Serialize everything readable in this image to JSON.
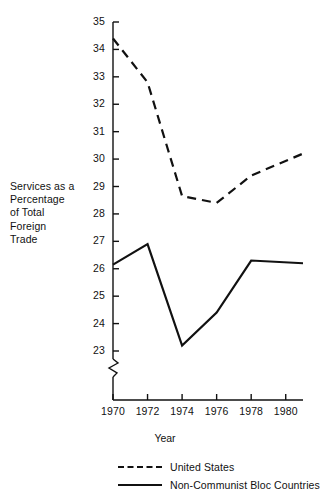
{
  "chart_data": {
    "type": "line",
    "title": "",
    "xlabel": "Year",
    "ylabel": "Services as a Percentage of Total Foreign Trade",
    "ylabel_lines": [
      "Services as a",
      "Percentage",
      "of Total",
      "Foreign",
      "Trade"
    ],
    "xlim": [
      1970,
      1981
    ],
    "ylim": [
      23,
      35
    ],
    "yticks": [
      23,
      24,
      25,
      26,
      27,
      28,
      29,
      30,
      31,
      32,
      33,
      34,
      35
    ],
    "ytick_labels": [
      "23",
      "24",
      "25",
      "26",
      "27",
      "28",
      "29",
      "30",
      "31",
      "32",
      "33",
      "34",
      "35"
    ],
    "xticks": [
      1970,
      1972,
      1974,
      1976,
      1978,
      1980
    ],
    "xtick_labels": [
      "1970",
      "1972",
      "1974",
      "1976",
      "1978",
      "1980"
    ],
    "axis_break": true,
    "axis_break_below": 23,
    "grid": false,
    "legend_position": "bottom",
    "line_color": "#111111",
    "series": [
      {
        "name": "United States",
        "style": "dashed",
        "x": [
          1970,
          1972,
          1974,
          1976,
          1978,
          1981
        ],
        "values": [
          34.4,
          32.8,
          28.65,
          28.4,
          29.4,
          30.2
        ]
      },
      {
        "name": "Non-Communist Bloc Countries",
        "style": "solid",
        "x": [
          1970,
          1972,
          1974,
          1976,
          1978,
          1981
        ],
        "values": [
          26.15,
          26.9,
          23.2,
          24.4,
          26.3,
          26.2
        ]
      }
    ]
  },
  "legend": {
    "items": [
      {
        "label": "United States",
        "style": "dashed"
      },
      {
        "label": "Non-Communist Bloc Countries",
        "style": "solid"
      }
    ]
  }
}
